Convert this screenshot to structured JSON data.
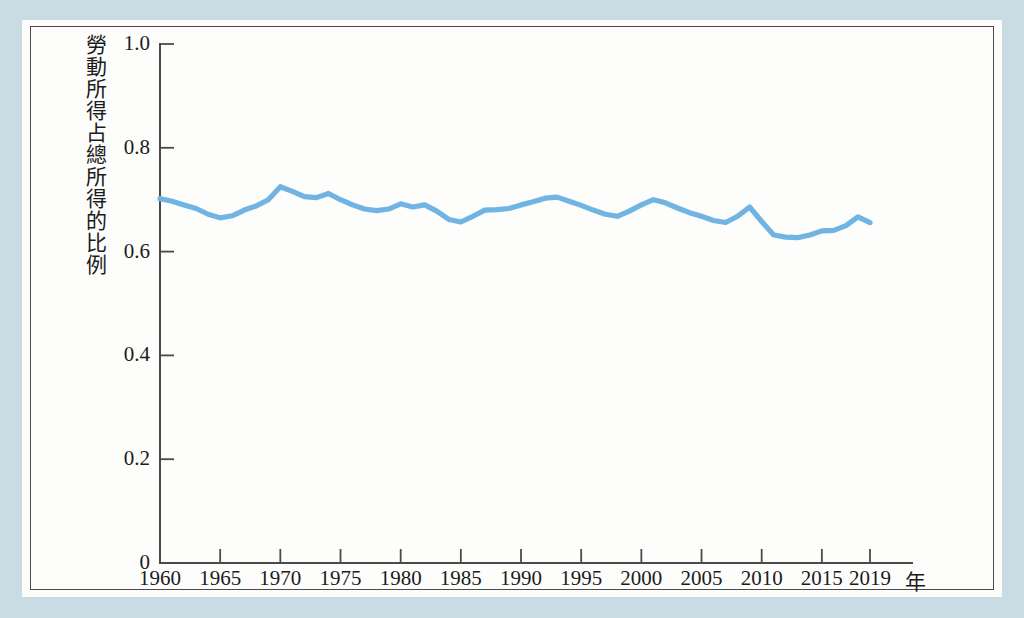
{
  "figure": {
    "background_color": "#c9dce4",
    "paper_color": "#fdfdfc",
    "frame_color": "#4a4a4a"
  },
  "chart_data": {
    "type": "line",
    "title": "",
    "subtitle": "",
    "xlabel": "年",
    "ylabel": "勞動所得占總所得的比例",
    "legend": [],
    "legend_position": "none",
    "grid": false,
    "xlim": [
      1960,
      2019
    ],
    "ylim": [
      0,
      1.0
    ],
    "yticks": [
      "0",
      "0.2",
      "0.4",
      "0.6",
      "0.8",
      "1.0"
    ],
    "ytick_values": [
      0,
      0.2,
      0.4,
      0.6,
      0.8,
      1.0
    ],
    "xticks": [
      "1960",
      "1965",
      "1970",
      "1975",
      "1980",
      "1985",
      "1990",
      "1995",
      "2000",
      "2005",
      "2010",
      "2015",
      "2019"
    ],
    "xtick_values": [
      1960,
      1965,
      1970,
      1975,
      1980,
      1985,
      1990,
      1995,
      2000,
      2005,
      2010,
      2015,
      2019
    ],
    "series": [
      {
        "name": "勞動所得占總所得的比例",
        "color": "#6fb4e2",
        "x": [
          1960,
          1961,
          1962,
          1963,
          1964,
          1965,
          1966,
          1967,
          1968,
          1969,
          1970,
          1971,
          1972,
          1973,
          1974,
          1975,
          1976,
          1977,
          1978,
          1979,
          1980,
          1981,
          1982,
          1983,
          1984,
          1985,
          1986,
          1987,
          1988,
          1989,
          1990,
          1991,
          1992,
          1993,
          1994,
          1995,
          1996,
          1997,
          1998,
          1999,
          2000,
          2001,
          2002,
          2003,
          2004,
          2005,
          2006,
          2007,
          2008,
          2009,
          2010,
          2011,
          2012,
          2013,
          2014,
          2015,
          2016,
          2017,
          2018,
          2019
        ],
        "values": [
          0.702,
          0.697,
          0.69,
          0.683,
          0.672,
          0.665,
          0.669,
          0.68,
          0.688,
          0.7,
          0.725,
          0.716,
          0.706,
          0.704,
          0.712,
          0.7,
          0.69,
          0.682,
          0.679,
          0.682,
          0.692,
          0.686,
          0.69,
          0.678,
          0.662,
          0.657,
          0.668,
          0.68,
          0.681,
          0.683,
          0.69,
          0.696,
          0.703,
          0.705,
          0.697,
          0.689,
          0.68,
          0.672,
          0.668,
          0.678,
          0.69,
          0.7,
          0.694,
          0.684,
          0.675,
          0.668,
          0.66,
          0.656,
          0.668,
          0.686,
          0.658,
          0.632,
          0.628,
          0.627,
          0.632,
          0.64,
          0.641,
          0.65,
          0.667,
          0.656
        ]
      }
    ]
  },
  "y_axis_title_chars": "勞動所得占總所得的比例",
  "x_axis_unit": "年"
}
